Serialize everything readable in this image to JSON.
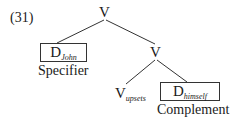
{
  "example_number": "(31)",
  "tree": {
    "root": {
      "label": "V"
    },
    "specifier": {
      "label": "D",
      "subscript": "John",
      "role": "Specifier"
    },
    "intermediate": {
      "label": "V"
    },
    "head": {
      "label": "V",
      "subscript": "upsets"
    },
    "complement": {
      "label": "D",
      "subscript": "himself",
      "role": "Complement"
    }
  }
}
